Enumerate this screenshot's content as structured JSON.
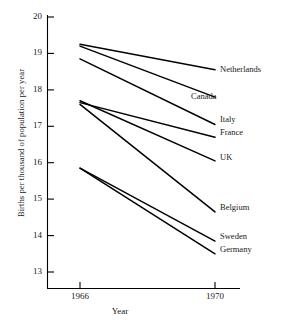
{
  "chart_data": {
    "type": "line",
    "title": "",
    "xlabel": "Year",
    "ylabel": "Births per thousand of population per year",
    "x": [
      1966,
      1970
    ],
    "xtick_labels": [
      "1966",
      "1970"
    ],
    "ytick_labels": [
      "20",
      "19",
      "18",
      "17",
      "16",
      "15",
      "14",
      "13"
    ],
    "yticks": [
      20,
      19,
      18,
      17,
      16,
      15,
      14,
      13
    ],
    "ylim": [
      12.6,
      20.0
    ],
    "xlim": [
      1965.2,
      1970.9
    ],
    "grid": false,
    "legend_position": "right-inline-labels",
    "line_color": "#000000",
    "series": [
      {
        "name": "Netherlands",
        "values": [
          19.25,
          18.55
        ]
      },
      {
        "name": "Canada",
        "values": [
          19.2,
          17.8
        ]
      },
      {
        "name": "Italy",
        "values": [
          18.85,
          17.05
        ]
      },
      {
        "name": "France",
        "values": [
          17.65,
          16.7
        ]
      },
      {
        "name": "UK",
        "values": [
          17.7,
          16.05
        ]
      },
      {
        "name": "Belgium",
        "values": [
          17.6,
          14.65
        ]
      },
      {
        "name": "Sweden",
        "values": [
          15.85,
          13.85
        ]
      },
      {
        "name": "Germany",
        "values": [
          15.85,
          13.5
        ]
      }
    ]
  },
  "labels": {
    "netherlands": "Netherlands",
    "canada": "Canada",
    "italy": "Italy",
    "france": "France",
    "uk": "UK",
    "belgium": "Belgium",
    "sweden": "Sweden",
    "germany": "Germany"
  },
  "axis": {
    "ylabel": "Births per thousand of population per year",
    "xlabel": "Year",
    "ytick_20": "20",
    "ytick_19": "19",
    "ytick_18": "18",
    "ytick_17": "17",
    "ytick_16": "16",
    "ytick_15": "15",
    "ytick_14": "14",
    "ytick_13": "13",
    "xtick_1966": "1966",
    "xtick_1970": "1970"
  }
}
